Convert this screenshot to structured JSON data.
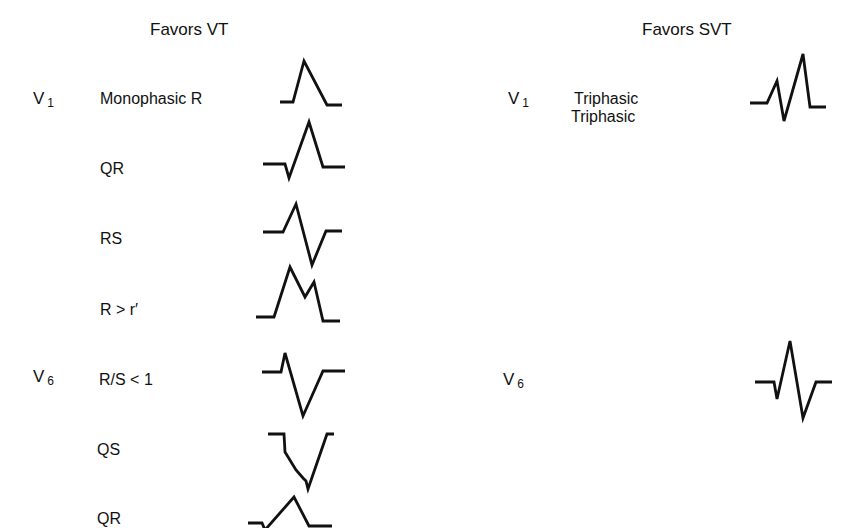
{
  "columns": {
    "vt": {
      "heading": "Favors VT"
    },
    "svt": {
      "heading": "Favors SVT"
    }
  },
  "leads": {
    "v1": {
      "letter": "V",
      "sub": "1"
    },
    "v6": {
      "letter": "V",
      "sub": "6"
    }
  },
  "vt_rows": [
    {
      "lead": "V1",
      "label": "Monophasic R",
      "waveform": "monophasic-r"
    },
    {
      "lead": "",
      "label": "QR",
      "waveform": "qr"
    },
    {
      "lead": "",
      "label": "RS",
      "waveform": "rs"
    },
    {
      "lead": "",
      "label": "R > r′",
      "waveform": "r-greater-than-r-prime"
    },
    {
      "lead": "V6",
      "label": "R/S < 1",
      "waveform": "rs-ratio-less-than-1"
    },
    {
      "lead": "",
      "label": "QS",
      "waveform": "qs"
    },
    {
      "lead": "",
      "label": "QR",
      "waveform": "qr"
    }
  ],
  "svt_rows": [
    {
      "lead": "V1",
      "label": "Triphasic",
      "waveform": "triphasic-rsr"
    },
    {
      "lead": "V6",
      "label": "Triphasic",
      "waveform": "triphasic-qrs"
    }
  ],
  "colors": {
    "ink": "#111111",
    "background": "#ffffff"
  }
}
